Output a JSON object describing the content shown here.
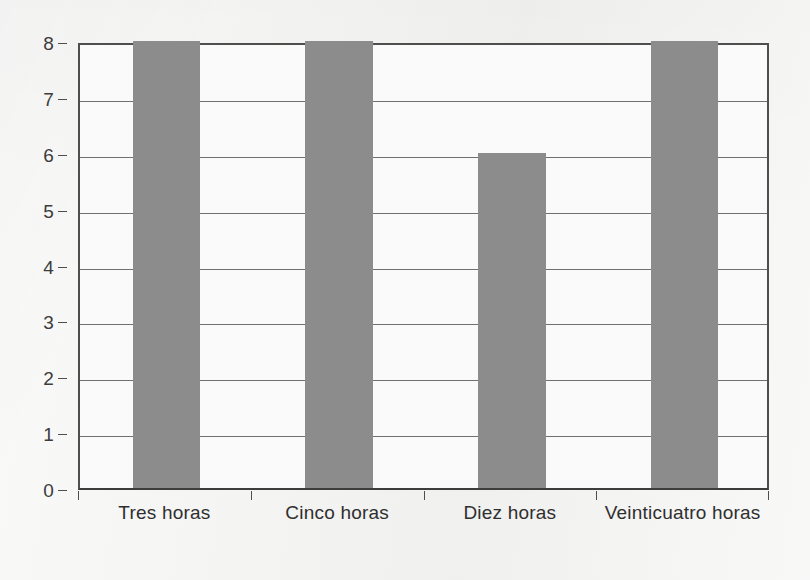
{
  "chart_data": {
    "type": "bar",
    "title": "",
    "subtitle": "",
    "xlabel": "",
    "ylabel": "",
    "categories": [
      "Tres horas",
      "Cinco horas",
      "Diez horas",
      "Veinticuatro horas"
    ],
    "values": [
      8,
      8,
      6,
      8
    ],
    "series": [
      {
        "name": "",
        "values": [
          8,
          8,
          6,
          8
        ]
      }
    ],
    "ylim": [
      0,
      8
    ],
    "xlim": [
      0,
      4
    ],
    "y_ticks": [
      0,
      1,
      2,
      3,
      4,
      5,
      6,
      7,
      8
    ],
    "y_tick_labels": [
      "0",
      "1",
      "2",
      "3",
      "4",
      "5",
      "6",
      "7",
      "8"
    ],
    "grid": true,
    "grid_axis": "y",
    "legend": false,
    "legend_position": "none",
    "bar_color": "#8c8c8c",
    "axis_color": "#4e4e4e",
    "gridline_color": "#6f6f6f",
    "plot_background": "#fafafa",
    "figure_background": "#f4f4f3",
    "text_color": "#2f2f2f"
  },
  "axes": {
    "y_axis_name": "y-axis",
    "x_axis_name": "x-axis"
  }
}
